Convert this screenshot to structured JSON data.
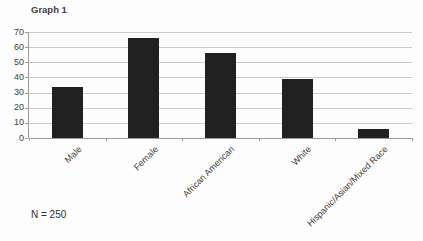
{
  "chart_data": {
    "type": "bar",
    "title": "Graph 1",
    "categories": [
      "Male",
      "Female",
      "African American",
      "White",
      "Hispanic/Asian/Mixed Race"
    ],
    "values": [
      34,
      66,
      56,
      39,
      6
    ],
    "xlabel": "",
    "ylabel": "",
    "ylim": [
      0,
      70
    ],
    "ytick_step": 10,
    "grid": "horizontal",
    "legend": "none",
    "bar_color": "#212121",
    "bar_width_px": 31
  },
  "annotations": {
    "sample_size": "N = 250"
  },
  "colors": {
    "background": "#fdfdfd",
    "gridline": "#cccccc",
    "axis": "#9b9b9b",
    "text": "#404040",
    "bar": "#212121"
  }
}
